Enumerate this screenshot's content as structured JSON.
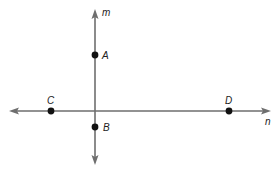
{
  "figure": {
    "type": "geometry-lines",
    "colors": {
      "line": "#6e6e6e",
      "point": "#111111",
      "label": "#222222",
      "background": "#ffffff"
    },
    "lines": [
      {
        "name": "m",
        "orientation": "vertical",
        "label": "m",
        "direction": "both-arrows"
      },
      {
        "name": "n",
        "orientation": "horizontal",
        "label": "n",
        "direction": "both-arrows"
      }
    ],
    "points": [
      {
        "name": "A",
        "label": "A",
        "on_line": "m"
      },
      {
        "name": "B",
        "label": "B",
        "on_line": "m"
      },
      {
        "name": "C",
        "label": "C",
        "on_line": "n"
      },
      {
        "name": "D",
        "label": "D",
        "on_line": "n"
      }
    ]
  }
}
